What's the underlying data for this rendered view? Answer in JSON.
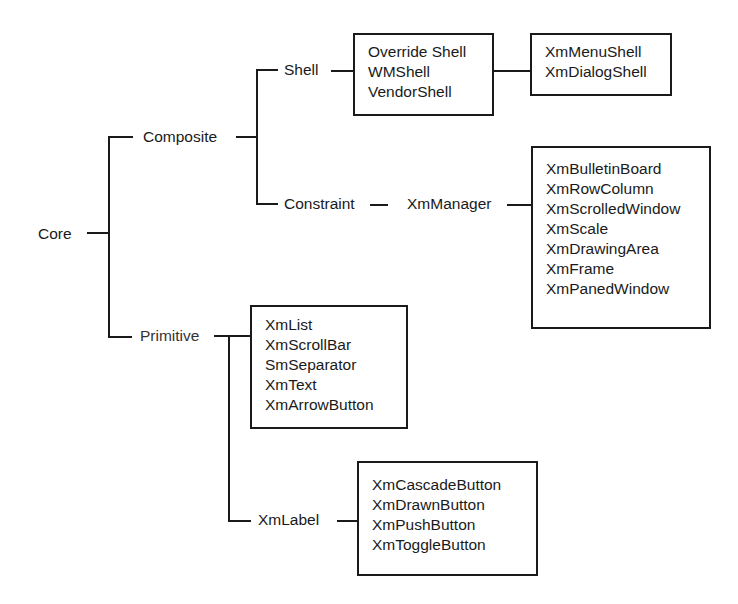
{
  "diagram": {
    "root": "Core",
    "nodes": {
      "core": "Core",
      "composite": "Composite",
      "shell": "Shell",
      "constraint": "Constraint",
      "xm_manager": "XmManager",
      "primitive": "Primitive",
      "xm_label": "XmLabel"
    },
    "boxes": {
      "shell_classes": [
        "Override Shell",
        "WMShell",
        "VendorShell"
      ],
      "vendor_subclasses": [
        "XmMenuShell",
        "XmDialogShell"
      ],
      "manager_subclasses": [
        "XmBulletinBoard",
        "XmRowColumn",
        "XmScrolledWindow",
        "XmScale",
        "XmDrawingArea",
        "XmFrame",
        "XmPanedWindow"
      ],
      "primitive_subclasses": [
        "XmList",
        "XmScrollBar",
        "SmSeparator",
        "XmText",
        "XmArrowButton"
      ],
      "label_subclasses": [
        "XmCascadeButton",
        "XmDrawnButton",
        "XmPushButton",
        "XmToggleButton"
      ]
    },
    "edges": [
      [
        "Core",
        "Composite"
      ],
      [
        "Core",
        "Primitive"
      ],
      [
        "Composite",
        "Shell"
      ],
      [
        "Composite",
        "Constraint"
      ],
      [
        "Shell",
        "shell_classes"
      ],
      [
        "shell_classes",
        "vendor_subclasses"
      ],
      [
        "Constraint",
        "XmManager"
      ],
      [
        "XmManager",
        "manager_subclasses"
      ],
      [
        "Primitive",
        "primitive_subclasses"
      ],
      [
        "Primitive",
        "XmLabel"
      ],
      [
        "XmLabel",
        "label_subclasses"
      ]
    ]
  }
}
